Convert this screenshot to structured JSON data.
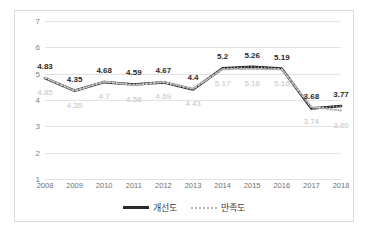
{
  "chart_data": {
    "type": "line",
    "title": "",
    "xlabel": "",
    "ylabel": "",
    "categories": [
      "2008",
      "2009",
      "2010",
      "2011",
      "2012",
      "2013",
      "2014",
      "2015",
      "2016",
      "2017",
      "2018"
    ],
    "ylim": [
      1,
      7
    ],
    "yticks": [
      1,
      2,
      3,
      4,
      5,
      6,
      7
    ],
    "grid": true,
    "legend_position": "bottom",
    "series": [
      {
        "name": "개선도",
        "style": "solid",
        "color": "#2b2b2b",
        "label_color": "#2b2b2b",
        "values": [
          4.83,
          4.35,
          4.68,
          4.59,
          4.67,
          4.4,
          5.2,
          5.26,
          5.19,
          3.68,
          3.77
        ],
        "labels": [
          "4.83",
          "4.35",
          "4.68",
          "4.59",
          "4.67",
          "4.4",
          "5.2",
          "5.26",
          "5.19",
          "3.68",
          "3.77"
        ]
      },
      {
        "name": "만족도",
        "style": "dotted",
        "color": "#b5b5b5",
        "label_color": "#c4c4c4",
        "values": [
          4.85,
          4.35,
          4.7,
          4.56,
          4.69,
          4.43,
          5.17,
          5.18,
          5.16,
          3.74,
          3.6
        ],
        "labels": [
          "4.85",
          "4.35",
          "4.7",
          "4.56",
          "4.69",
          "4.43",
          "5.17",
          "5.18",
          "5.16",
          "3.74",
          "3.60"
        ]
      }
    ]
  },
  "legend": {
    "items": [
      {
        "label": "개선도",
        "marker": "solid-line-marker"
      },
      {
        "label": "만족도",
        "marker": "dotted-line-marker"
      }
    ]
  }
}
